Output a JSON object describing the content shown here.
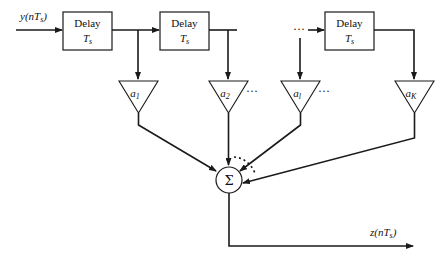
{
  "diagram": {
    "input": {
      "label": "y(nT_s)",
      "text_main": "y(nT",
      "text_sub": "s",
      "text_close": ")"
    },
    "output": {
      "label": "z(nT_s)",
      "text_main": "z(nT",
      "text_sub": "s",
      "text_close": ")"
    },
    "delays": [
      {
        "line1": "Delay",
        "line2_main": "T",
        "line2_sub": "s"
      },
      {
        "line1": "Delay",
        "line2_main": "T",
        "line2_sub": "s"
      },
      {
        "line1": "Delay",
        "line2_main": "T",
        "line2_sub": "s"
      }
    ],
    "gains": [
      {
        "main": "a",
        "sub": "1"
      },
      {
        "main": "a",
        "sub": "2"
      },
      {
        "main": "a",
        "sub": "l"
      },
      {
        "main": "a",
        "sub": "K"
      }
    ],
    "summer": {
      "symbol": "Σ"
    },
    "ellipsis": "···"
  }
}
